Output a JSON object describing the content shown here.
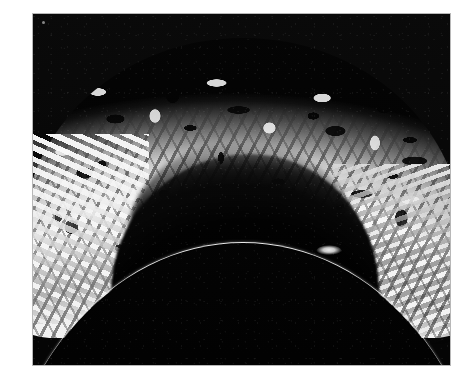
{
  "page": {
    "background_color": "#ffffff",
    "width": 470,
    "height": 388
  },
  "photograph": {
    "name": "monochrome-astronomical-limb-photograph",
    "media": "black-and-white photographic print",
    "background_color": "#050505",
    "highlight_color": "#f4f4f4",
    "limb_color": "#f2f2f2",
    "frame": {
      "left": 33,
      "top": 14,
      "width": 417,
      "height": 351,
      "border_color": "#b8b8b8"
    },
    "features": [
      {
        "id": "bright-dome",
        "label": "bright mottled dome structure",
        "description": "Large arch-shaped, high-contrast granular bright mass rising from the lower-left to upper-center of the frame"
      },
      {
        "id": "dark-cavity",
        "label": "shadowed interior cavity",
        "description": "Deep black arched void beneath the bright crust, centered in the lower middle of the frame"
      },
      {
        "id": "limb-arc",
        "label": "thin bright curved limb",
        "description": "Narrow luminous arc sweeping across the lower third of the frame, apex near the horizontal center"
      },
      {
        "id": "limb-knot",
        "label": "bright knot on limb",
        "description": "Small elongated bright condensation sitting on the limb right of center"
      },
      {
        "id": "right-flank",
        "label": "ragged right flank",
        "description": "Streaky bright filaments trailing down the right side toward the limb"
      },
      {
        "id": "left-flank",
        "label": "left crust flank",
        "description": "Bright mottled crust extending to the left edge of the frame"
      },
      {
        "id": "speck-artifact",
        "label": "emulsion speck",
        "description": "Tiny bright dust/emulsion speck near the upper-left corner of the print"
      }
    ]
  }
}
